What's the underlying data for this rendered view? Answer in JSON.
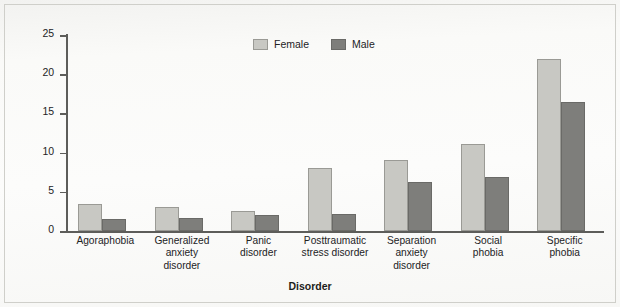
{
  "chart_data": {
    "type": "bar",
    "title": "",
    "xlabel": "Disorder",
    "ylabel": "Rate (%)",
    "ylim": [
      0,
      25
    ],
    "yticks": [
      0,
      5,
      10,
      15,
      20,
      25
    ],
    "grid": false,
    "legend_position": "top-center",
    "categories": [
      "Agoraphobia",
      "Generalized anxiety disorder",
      "Panic disorder",
      "Posttraumatic stress disorder",
      "Separation anxiety disorder",
      "Social phobia",
      "Specific phobia"
    ],
    "category_lines": [
      [
        "Agoraphobia"
      ],
      [
        "Generalized",
        "anxiety",
        "disorder"
      ],
      [
        "Panic",
        "disorder"
      ],
      [
        "Posttraumatic",
        "stress disorder"
      ],
      [
        "Separation",
        "anxiety",
        "disorder"
      ],
      [
        "Social",
        "phobia"
      ],
      [
        "Specific",
        "phobia"
      ]
    ],
    "series": [
      {
        "name": "Female",
        "color": "#c8c8c3",
        "values": [
          3.4,
          3.0,
          2.5,
          8.0,
          9.0,
          11.1,
          22.0
        ]
      },
      {
        "name": "Male",
        "color": "#7e7e7b",
        "values": [
          1.5,
          1.6,
          2.0,
          2.2,
          6.2,
          6.9,
          16.5
        ]
      }
    ]
  },
  "axis": {
    "y_label": "Rate (%)",
    "x_label": "Disorder",
    "y_tick_labels": [
      "0",
      "5",
      "10",
      "15",
      "20",
      "25"
    ]
  },
  "legend": {
    "items": [
      {
        "label": "Female",
        "color": "#c8c8c3"
      },
      {
        "label": "Male",
        "color": "#7e7e7b"
      }
    ]
  }
}
